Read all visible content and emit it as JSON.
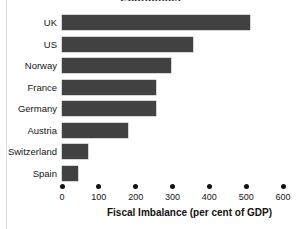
{
  "chart_data": {
    "type": "bar",
    "orientation": "horizontal",
    "title": "Economics",
    "categories": [
      "UK",
      "US",
      "Norway",
      "France",
      "Germany",
      "Austria",
      "Switzerland",
      "Spain"
    ],
    "values": [
      510,
      355,
      295,
      255,
      255,
      180,
      70,
      43
    ],
    "xlabel": "Fiscal Imbalance (per cent of GDP)",
    "ylabel": "",
    "xlim": [
      0,
      600
    ],
    "xticks": [
      0,
      100,
      200,
      300,
      400,
      500,
      600
    ],
    "xtick_labels": [
      "0",
      "100",
      "200",
      "300",
      "400",
      "500",
      "600"
    ],
    "grid": false,
    "legend": false,
    "bar_color": "#414141",
    "background_color": "#ffffff",
    "tick_marker": "dot"
  }
}
